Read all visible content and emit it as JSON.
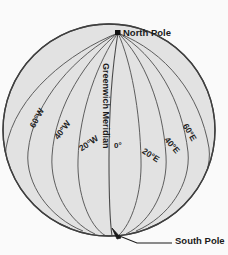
{
  "figure": {
    "background_color": "#fafafa",
    "globe_fill_color": "#e2e2e2",
    "globe_line_color": "#4a4a4a",
    "label_color": "#1a1a1a"
  },
  "poles": {
    "north": {
      "label": "North Pole",
      "marker": "square-marker",
      "x": 118,
      "y": 33
    },
    "south": {
      "label": "South Pole",
      "leader": "arrow-leader-line",
      "target_x": 113,
      "target_y": 228
    }
  },
  "greenwich": {
    "label": "Greenwich Meridian",
    "zero_label": "0°"
  },
  "meridians": [
    {
      "label": "60°W",
      "degrees": -60,
      "x": 32,
      "y": 123,
      "rotate": -62
    },
    {
      "label": "40°W",
      "degrees": -40,
      "x": 56,
      "y": 134,
      "rotate": -52
    },
    {
      "label": "20°W",
      "degrees": -20,
      "x": 80,
      "y": 145,
      "rotate": -34
    },
    {
      "label": "20°E",
      "degrees": 20,
      "x": 143,
      "y": 146,
      "rotate": 33
    },
    {
      "label": "40°E",
      "degrees": 40,
      "x": 166,
      "y": 134,
      "rotate": 50
    },
    {
      "label": "60°E",
      "degrees": 60,
      "x": 185,
      "y": 120,
      "rotate": 60
    }
  ],
  "geometry": {
    "center_x": 109,
    "center_y": 130,
    "radius": 106,
    "meridian_count": 9,
    "meridian_spacing_degrees": 20
  }
}
